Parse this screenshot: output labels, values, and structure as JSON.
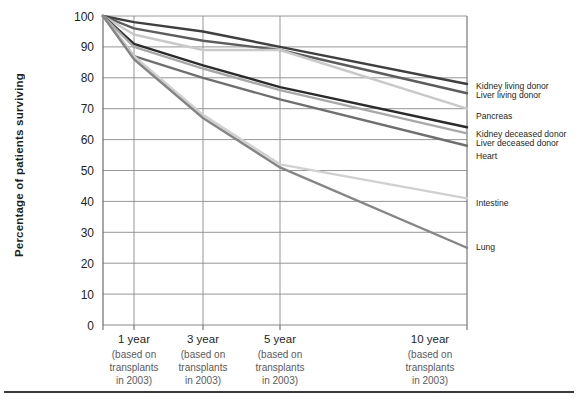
{
  "figure": {
    "ylabel": "Percentage of patients surviving",
    "bottom_rule": true
  },
  "chart_data": {
    "type": "line",
    "title": "",
    "xlabel": "",
    "ylabel": "Percentage of patients surviving",
    "ylim": [
      0,
      100
    ],
    "ytick_step": 10,
    "yticks": [
      "100",
      "90",
      "80",
      "70",
      "60",
      "50",
      "40",
      "30",
      "20",
      "10",
      "0"
    ],
    "grid": true,
    "legend_position": "right-of-axes",
    "x": [
      0,
      1,
      3,
      5,
      10
    ],
    "categories": [
      "0",
      "1 year",
      "3 year",
      "5 year",
      "10 year"
    ],
    "xtick_labels": [
      {
        "main": "1 year",
        "sub": [
          "(based on",
          "transplants",
          "in 2003)"
        ]
      },
      {
        "main": "3 year",
        "sub": [
          "(based on",
          "transplants",
          "in 2003)"
        ]
      },
      {
        "main": "5 year",
        "sub": [
          "(based on",
          "transplants",
          "in 2003)"
        ]
      },
      {
        "main": "10 year",
        "sub": [
          "(based on",
          "transplants",
          "in 2003)"
        ]
      }
    ],
    "series": [
      {
        "name": "Kidney living donor",
        "color": "#3f3f3f",
        "width": 2.4,
        "values": [
          100,
          98,
          95,
          90,
          78
        ]
      },
      {
        "name": "Liver living donor",
        "color": "#5d5d5d",
        "width": 2.4,
        "values": [
          100,
          96,
          92,
          89,
          75
        ]
      },
      {
        "name": "Pancreas",
        "color": "#c9c9c9",
        "width": 2.4,
        "values": [
          100,
          94,
          89,
          89,
          70
        ]
      },
      {
        "name": "Kidney deceased donor",
        "color": "#2b2b2b",
        "width": 2.4,
        "values": [
          100,
          91,
          84,
          77,
          64
        ]
      },
      {
        "name": "Liver deceased donor",
        "color": "#a8a8a8",
        "width": 2.4,
        "values": [
          100,
          90,
          83,
          76,
          62
        ]
      },
      {
        "name": "Heart",
        "color": "#6f6f6f",
        "width": 2.4,
        "values": [
          100,
          87,
          80,
          73,
          58
        ]
      },
      {
        "name": "Intestine",
        "color": "#d0d0d0",
        "width": 2.4,
        "values": [
          100,
          87,
          68,
          52,
          41
        ]
      },
      {
        "name": "Lung",
        "color": "#858585",
        "width": 2.4,
        "values": [
          100,
          86,
          67,
          51,
          25
        ]
      }
    ],
    "endpoint_labels": [
      {
        "label": "Kidney living donor",
        "value": 78
      },
      {
        "label": "Liver living donor",
        "value": 75
      },
      {
        "label": "Pancreas",
        "value": 70
      },
      {
        "label": "Kidney deceased donor",
        "value": 64
      },
      {
        "label": "Liver deceased donor",
        "value": 62
      },
      {
        "label": "Heart",
        "value": 58
      },
      {
        "label": "Intestine",
        "value": 41
      },
      {
        "label": "Lung",
        "value": 25
      }
    ],
    "colors": {
      "axis": "#6b6b6b",
      "grid": "#8a8a8a",
      "text": "#231f20",
      "subtext": "#5a5a5a"
    }
  }
}
